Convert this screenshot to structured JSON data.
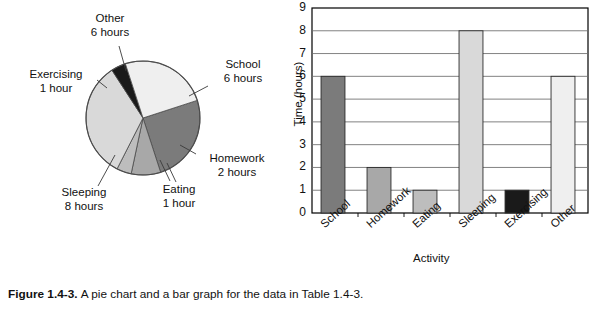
{
  "caption": {
    "figure_number": "Figure 1.4-3.",
    "text": "A pie chart and a bar graph for the data in Table 1.4-3."
  },
  "chart_data": [
    {
      "type": "pie",
      "title": "",
      "categories": [
        "School",
        "Homework",
        "Eating",
        "Sleeping",
        "Exercising",
        "Other"
      ],
      "values": [
        6,
        2,
        1,
        8,
        1,
        6
      ],
      "unit": "hours",
      "total": 24,
      "legend": "none",
      "slice_labels": [
        {
          "name": "School",
          "line1": "School",
          "line2": "6 hours"
        },
        {
          "name": "Homework",
          "line1": "Homework",
          "line2": "2 hours"
        },
        {
          "name": "Eating",
          "line1": "Eating",
          "line2": "1 hour"
        },
        {
          "name": "Sleeping",
          "line1": "Sleeping",
          "line2": "8 hours"
        },
        {
          "name": "Exercising",
          "line1": "Exercising",
          "line2": "1 hour"
        },
        {
          "name": "Other",
          "line1": "Other",
          "line2": "6 hours"
        }
      ],
      "colors": [
        "#7b7b7b",
        "#a8a8a8",
        "#bdbdbd",
        "#d9d9d9",
        "#1a1a1a",
        "#efefef"
      ]
    },
    {
      "type": "bar",
      "title": "",
      "categories": [
        "School",
        "Homework",
        "Eating",
        "Sleeping",
        "Exercising",
        "Other"
      ],
      "values": [
        6,
        2,
        1,
        8,
        1,
        6
      ],
      "xlabel": "Activity",
      "ylabel": "Time (hours)",
      "ylim": [
        0,
        9
      ],
      "yticks": [
        0,
        1,
        2,
        3,
        4,
        5,
        6,
        7,
        8,
        9
      ],
      "grid": true,
      "legend": "none",
      "colors": [
        "#7b7b7b",
        "#a8a8a8",
        "#bdbdbd",
        "#d9d9d9",
        "#1a1a1a",
        "#efefef"
      ]
    }
  ]
}
